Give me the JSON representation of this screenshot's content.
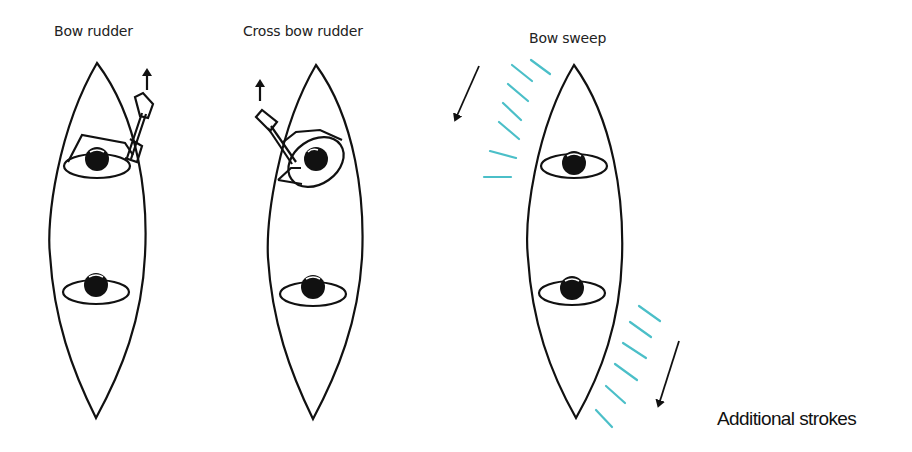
{
  "diagrams": [
    {
      "id": "bow-rudder",
      "title": "Bow rudder"
    },
    {
      "id": "cross-bow-rudder",
      "title": "Cross bow rudder"
    },
    {
      "id": "bow-sweep",
      "title": "Bow sweep"
    }
  ],
  "caption": "Additional strokes",
  "colors": {
    "line": "#111111",
    "stroke_trail": "#4bbfc8",
    "background": "#ffffff"
  }
}
